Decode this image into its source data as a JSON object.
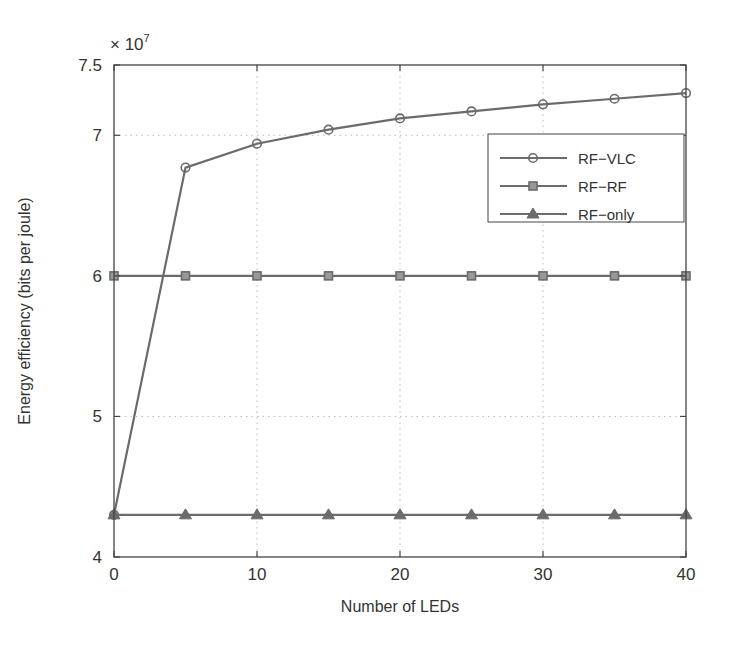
{
  "chart_data": {
    "type": "line",
    "title": "",
    "xlabel": "Number of LEDs",
    "ylabel": "Energy efficiency (bits per joule)",
    "y_multiplier": "× 10",
    "y_multiplier_exp": "7",
    "xlim": [
      0,
      40
    ],
    "ylim": [
      4,
      7.5
    ],
    "x_ticks": [
      0,
      10,
      20,
      30,
      40
    ],
    "x_tick_labels": [
      "0",
      "10",
      "20",
      "30",
      "40"
    ],
    "y_ticks": [
      4,
      5,
      6,
      7,
      7.5
    ],
    "y_tick_labels": [
      "4",
      "5",
      "6",
      "7",
      "7.5"
    ],
    "grid": true,
    "legend_position": "upper right",
    "x": [
      0,
      5,
      10,
      15,
      20,
      25,
      30,
      35,
      40
    ],
    "series": [
      {
        "name": "RF−VLC",
        "marker": "circle",
        "values": [
          4.3,
          6.77,
          6.94,
          7.04,
          7.12,
          7.17,
          7.22,
          7.26,
          7.3
        ]
      },
      {
        "name": "RF−RF",
        "marker": "square",
        "values": [
          6.0,
          6.0,
          6.0,
          6.0,
          6.0,
          6.0,
          6.0,
          6.0,
          6.0
        ]
      },
      {
        "name": "RF−only",
        "marker": "triangle",
        "values": [
          4.3,
          4.3,
          4.3,
          4.3,
          4.3,
          4.3,
          4.3,
          4.3,
          4.3
        ]
      }
    ]
  },
  "colors": {
    "line": "#6b6b6b",
    "axis": "#444444",
    "grid": "#bdbdbd",
    "text": "#333333"
  }
}
